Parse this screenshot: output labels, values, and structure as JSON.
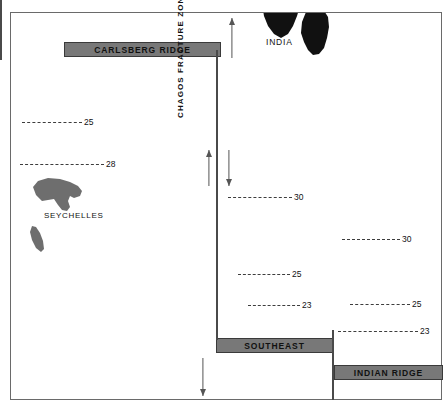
{
  "figure": {
    "type": "map"
  },
  "ridges": [
    {
      "id": "carlsberg",
      "label": "CARLSBERG RIDGE"
    },
    {
      "id": "southeast",
      "label": "SOUTHEAST"
    },
    {
      "id": "indian_ridge",
      "label": "INDIAN RIDGE"
    }
  ],
  "fracture_zone": {
    "label": "CHAGOS FRACTURE ZONE"
  },
  "landmasses": [
    {
      "id": "india",
      "label": "INDIA",
      "fill": "#111111"
    },
    {
      "id": "seychelles",
      "label": "SEYCHELLES",
      "fill": "#6e6e6e"
    }
  ],
  "anomalies": {
    "left": [
      {
        "id": "l25",
        "label": "25"
      },
      {
        "id": "l28",
        "label": "28"
      }
    ],
    "center": [
      {
        "id": "c30",
        "label": "30"
      },
      {
        "id": "c25",
        "label": "25"
      },
      {
        "id": "c23",
        "label": "23"
      }
    ],
    "right": [
      {
        "id": "r30",
        "label": "30"
      },
      {
        "id": "r25",
        "label": "25"
      },
      {
        "id": "r23",
        "label": "23"
      }
    ]
  },
  "colors": {
    "ridge_fill": "#787878",
    "ridge_stroke": "#3a3a3a",
    "frame": "#6a6a6a",
    "line": "#4a4a4a",
    "dash": "#3d3d3d",
    "india_fill": "#111111",
    "seychelles_fill": "#6e6e6e"
  }
}
